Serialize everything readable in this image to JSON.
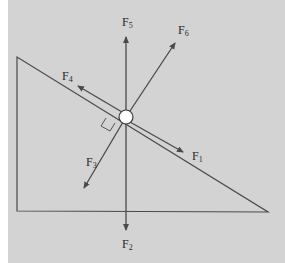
{
  "diagram": {
    "type": "free-body diagram on inclined plane",
    "colors": {
      "background": "#d3d3d3",
      "margin": "#ffffff",
      "line": "#4a4a4a",
      "body": "#ffffff"
    },
    "incline": {
      "vertices": [
        [
          17,
          57
        ],
        [
          17,
          211
        ],
        [
          268,
          212
        ]
      ]
    },
    "body": {
      "center": [
        126,
        117
      ],
      "radius": 7
    },
    "right_angle_marker": true,
    "forces": [
      {
        "id": "F1",
        "base": "F",
        "sub": "1",
        "direction": "down the incline",
        "end": [
          183,
          152
        ],
        "label_pos": [
          196,
          160
        ]
      },
      {
        "id": "F2",
        "base": "F",
        "sub": "2",
        "direction": "vertically down",
        "end": [
          126,
          230
        ],
        "label_pos": [
          122,
          248
        ]
      },
      {
        "id": "F3",
        "base": "F",
        "sub": "3",
        "direction": "perpendicular into incline",
        "end": [
          84,
          188
        ],
        "label_pos": [
          86,
          166
        ]
      },
      {
        "id": "F4",
        "base": "F",
        "sub": "4",
        "direction": "up the incline",
        "end": [
          78,
          86
        ],
        "label_pos": [
          62,
          80
        ]
      },
      {
        "id": "F5",
        "base": "F",
        "sub": "5",
        "direction": "vertically up",
        "end": [
          126,
          37
        ],
        "label_pos": [
          122,
          26
        ]
      },
      {
        "id": "F6",
        "base": "F",
        "sub": "6",
        "direction": "up and to the right",
        "end": [
          175,
          43
        ],
        "label_pos": [
          178,
          34
        ]
      }
    ]
  }
}
